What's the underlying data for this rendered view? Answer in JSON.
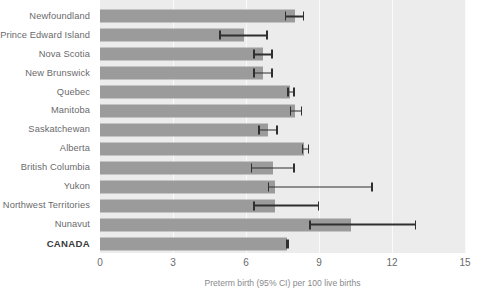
{
  "chart_data": {
    "type": "bar",
    "orientation": "horizontal",
    "title": "",
    "subtitle": "",
    "xlabel": "Preterm birth (95% CI) per 100 live births",
    "ylabel": "",
    "xlim": [
      0,
      15
    ],
    "ticks": [
      "0",
      "3",
      "6",
      "9",
      "12",
      "15"
    ],
    "tick_values": [
      0,
      3,
      6,
      9,
      12,
      15
    ],
    "grid": true,
    "grid_axis": "x",
    "legend": "none",
    "categories": [
      "Newfoundland",
      "Prince Edward Island",
      "Nova Scotia",
      "New Brunswick",
      "Quebec",
      "Manitoba",
      "Saskatchewan",
      "Alberta",
      "British Columbia",
      "Yukon",
      "Northwest Territories",
      "Nunavut",
      "CANADA"
    ],
    "values": [
      8.0,
      5.9,
      6.7,
      6.7,
      7.8,
      8.0,
      6.9,
      8.4,
      7.1,
      7.2,
      7.2,
      10.3,
      7.7
    ],
    "ci_low": [
      7.6,
      4.9,
      6.3,
      6.3,
      7.7,
      7.8,
      6.5,
      8.3,
      6.2,
      6.9,
      6.3,
      8.6,
      7.65
    ],
    "ci_high": [
      8.4,
      6.9,
      7.1,
      7.1,
      8.0,
      8.3,
      7.3,
      8.6,
      8.0,
      11.2,
      9.0,
      13.0,
      7.78
    ],
    "emphasis_category": "CANADA"
  },
  "colors": {
    "bar": "#9b9b9b",
    "plot_background": "#ececec",
    "gridline": "#fafafa",
    "error_bar": "#2f2f2f",
    "label_text": "#6a6a6c",
    "total_label_text": "#3a3a3c",
    "page_background": "#ffffff"
  }
}
